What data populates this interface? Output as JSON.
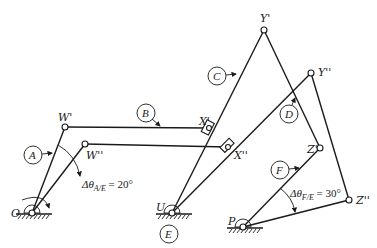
{
  "diagram": {
    "type": "linkage mechanism, two positions",
    "colors": {
      "line": "#1a1a1a",
      "background": "#ffffff"
    },
    "points": {
      "O": {
        "label": "O",
        "x": 32,
        "y": 213
      },
      "W1": {
        "label": "W'",
        "x": 65,
        "y": 127
      },
      "W2": {
        "label": "W''",
        "x": 85,
        "y": 144
      },
      "X1": {
        "label": "X'",
        "x": 209,
        "y": 128
      },
      "X2": {
        "label": "X''",
        "x": 228,
        "y": 147
      },
      "U": {
        "label": "U",
        "x": 172,
        "y": 213
      },
      "Y1": {
        "label": "Y'",
        "x": 264,
        "y": 30
      },
      "Y2": {
        "label": "Y''",
        "x": 311,
        "y": 73
      },
      "Z1": {
        "label": "Z'",
        "x": 320,
        "y": 148
      },
      "Z2": {
        "label": "Z''",
        "x": 349,
        "y": 200
      },
      "P": {
        "label": "P",
        "x": 243,
        "y": 227
      }
    },
    "links": [
      {
        "id": "A",
        "label": "A"
      },
      {
        "id": "B",
        "label": "B"
      },
      {
        "id": "C",
        "label": "C"
      },
      {
        "id": "D",
        "label": "D"
      },
      {
        "id": "E",
        "label": "E"
      },
      {
        "id": "F",
        "label": "F"
      }
    ],
    "annotations": {
      "angle_A": {
        "text": "Δθ",
        "sub": "A/E",
        "value": " = 20°"
      },
      "angle_F": {
        "text": "Δθ",
        "sub": "F/E",
        "value": " = 30°"
      }
    }
  }
}
